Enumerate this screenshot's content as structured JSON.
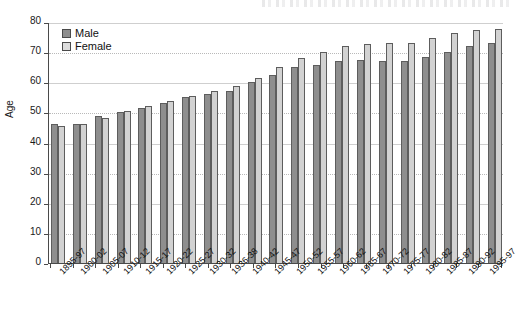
{
  "chart_data": {
    "type": "bar",
    "title": "",
    "xlabel": "",
    "ylabel": "Age",
    "ylim": [
      0,
      80
    ],
    "ytick_step": 10,
    "yticks": [
      "80",
      "70",
      "60",
      "50",
      "40",
      "30",
      "20",
      "10",
      "0"
    ],
    "grid": true,
    "legend_position": "top-left",
    "categories": [
      "1895-97",
      "1900-02",
      "1905-07",
      "1910-12",
      "1915-17",
      "1920-22",
      "1925-27",
      "1930-32",
      "1936-38",
      "1940-42",
      "1945-47",
      "1950-52",
      "1955-57",
      "1960-62",
      "1965-67",
      "1970-72",
      "1975-77",
      "1980-82",
      "1985-87",
      "1990-92",
      "1995-97"
    ],
    "series": [
      {
        "name": "Male",
        "color": "#8e8e8e",
        "values": [
          46.0,
          46.3,
          48.7,
          50.0,
          51.5,
          53.0,
          55.0,
          56.0,
          57.2,
          60.0,
          62.3,
          65.0,
          65.7,
          67.0,
          67.5,
          67.0,
          66.9,
          68.5,
          70.2,
          72.0,
          73.0
        ]
      },
      {
        "name": "Female",
        "color": "#d2d2d2",
        "values": [
          45.5,
          46.3,
          48.3,
          50.5,
          52.0,
          53.7,
          55.4,
          57.2,
          58.8,
          61.5,
          65.2,
          68.2,
          70.0,
          72.0,
          72.6,
          73.2,
          73.2,
          74.8,
          76.4,
          77.5,
          77.8
        ]
      }
    ]
  },
  "legend": {
    "items": [
      {
        "label": "Male"
      },
      {
        "label": "Female"
      }
    ]
  }
}
